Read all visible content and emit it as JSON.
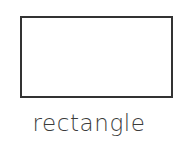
{
  "card": {
    "background_color": "#ffffff",
    "figure": {
      "icon_name": "rectangle-outline-icon",
      "shape": "rectangle",
      "fill_color": "#ffffff",
      "stroke_color": "#333333",
      "stroke_width": 2,
      "width": 153,
      "height": 82
    },
    "caption": {
      "text": "rectangle",
      "color": "#3b3b3b"
    }
  }
}
